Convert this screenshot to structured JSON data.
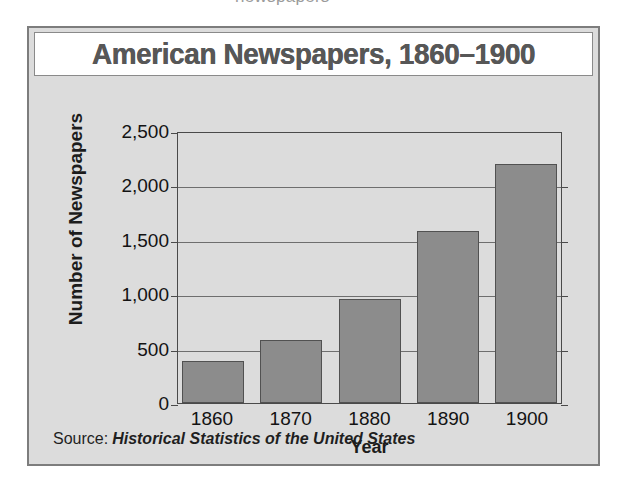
{
  "top_fragment": "newspapers",
  "figure": {
    "title": "American Newspapers, 1860–1900",
    "source_label": "Source:",
    "source_title": "Historical Statistics of the United States"
  },
  "chart_data": {
    "type": "bar",
    "title": "American Newspapers, 1860–1900",
    "xlabel": "Year",
    "ylabel": "Number of Newspapers",
    "categories": [
      "1860",
      "1870",
      "1880",
      "1890",
      "1900"
    ],
    "values": [
      390,
      575,
      960,
      1580,
      2200
    ],
    "ylim": [
      0,
      2500
    ],
    "ytick_values": [
      0,
      500,
      1000,
      1500,
      2000,
      2500
    ],
    "ytick_labels": [
      "0",
      "500",
      "1,000",
      "1,500",
      "2,000",
      "2,500"
    ],
    "grid": true,
    "legend": "none",
    "bar_color": "#8c8c8c",
    "plot_background": "#dcdcdc",
    "source": "Source: Historical Statistics of the United States"
  }
}
